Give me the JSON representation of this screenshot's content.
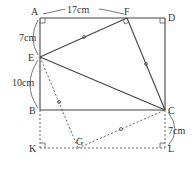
{
  "diagram": {
    "points": {
      "A": {
        "label": "A",
        "x": 40,
        "y": 18
      },
      "F": {
        "label": "F",
        "x": 127,
        "y": 18
      },
      "D": {
        "label": "D",
        "x": 165,
        "y": 18
      },
      "E": {
        "label": "E",
        "x": 40,
        "y": 57
      },
      "B": {
        "label": "B",
        "x": 40,
        "y": 110
      },
      "C": {
        "label": "C",
        "x": 165,
        "y": 110
      },
      "K": {
        "label": "K",
        "x": 40,
        "y": 148
      },
      "G": {
        "label": "G",
        "x": 78,
        "y": 148
      },
      "L": {
        "label": "L",
        "x": 165,
        "y": 148
      }
    },
    "measurements": {
      "AF": "17cm",
      "AE": "7cm",
      "EB": "10cm",
      "CL": "7cm"
    },
    "solid_segments": [
      "AD",
      "DC",
      "AB",
      "BC",
      "EF",
      "FC",
      "EC"
    ],
    "dashed_segments": [
      "BK",
      "KL",
      "LC",
      "EG",
      "GC"
    ],
    "right_angles": [
      "A",
      "D",
      "F",
      "K",
      "L"
    ],
    "equal_marks": [
      "EF",
      "FC",
      "EG",
      "GC"
    ]
  }
}
